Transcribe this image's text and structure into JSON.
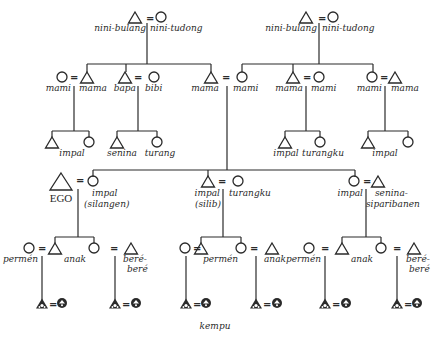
{
  "diagram": {
    "title_caption": "kempu",
    "ego_label": "EGO",
    "generations": {
      "g1_left": {
        "male": "nini-bulang",
        "female": "nini-tudong"
      },
      "g1_right": {
        "male": "nini-bulang",
        "female": "nini-tudong"
      },
      "g2": [
        {
          "female": "mami",
          "male": "mama"
        },
        {
          "male": "bapa",
          "female": "bibi"
        },
        {
          "male": "mama"
        },
        {
          "female": "mami"
        },
        {
          "male": "mama",
          "female": "mami"
        },
        {
          "female": "mami",
          "male": "mama"
        }
      ],
      "g3_upper": [
        {
          "label": "impal"
        },
        {
          "male": "senina",
          "female": "turang"
        },
        {
          "male": "impal",
          "female": "turangku"
        },
        {
          "label": "impal"
        }
      ],
      "g3_ego_row": [
        {
          "female": "impal",
          "sub": "(silangen)"
        },
        {
          "male": "impal",
          "sub": "(silib)",
          "female": "turangku"
        },
        {
          "female": "impal",
          "male": "senina-",
          "male2": "siparibanen"
        }
      ],
      "g4": [
        {
          "left": "permén",
          "mid": "anak",
          "right": "beré-",
          "right2": "beré"
        },
        {
          "left": "permén",
          "right": "anak"
        },
        {
          "left": "permén",
          "mid": "anak",
          "right": "beré-",
          "right2": "beré"
        }
      ]
    },
    "symbols": {
      "male": "triangle",
      "female": "circle",
      "marriage": "=",
      "grandchild_male": "filled-triangle",
      "grandchild_female": "filled-circle"
    }
  }
}
